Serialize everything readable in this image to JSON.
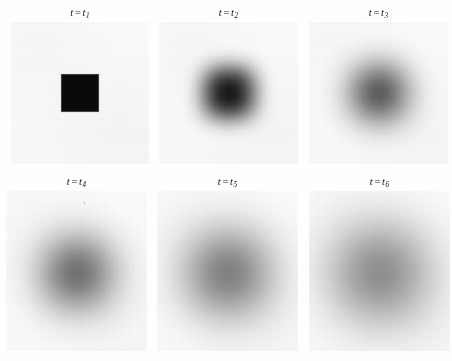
{
  "figure": {
    "title": "",
    "background_color": "#fefefe",
    "panel_background_color": "#fbfbfa",
    "blob_color": "#0a0a0a",
    "rows": 2,
    "columns": 3
  },
  "panels": [
    {
      "id": "panel-t1",
      "label_prefix": "t",
      "label_eq": "=",
      "label_var": "t",
      "label_sub": "1",
      "label_text": "t = t1",
      "state": "sharp-square",
      "x": 11,
      "y": 22,
      "width": 138,
      "height": 142,
      "blob": {
        "size": 37,
        "radius": 0,
        "blur": 0,
        "opacity": 1.0,
        "offset_x": 0,
        "offset_y": 0
      }
    },
    {
      "id": "panel-t2",
      "label_prefix": "t",
      "label_eq": "=",
      "label_var": "t",
      "label_sub": "2",
      "label_text": "t = t2",
      "state": "blurred-square",
      "x": 159,
      "y": 22,
      "width": 139,
      "height": 142,
      "blob": {
        "size": 48,
        "radius": 12,
        "blur": 11,
        "opacity": 0.97,
        "offset_x": 0,
        "offset_y": 0
      }
    },
    {
      "id": "panel-t3",
      "label_prefix": "t",
      "label_eq": "=",
      "label_var": "t",
      "label_sub": "3",
      "label_text": "t = t3",
      "state": "rounded-blob",
      "x": 309,
      "y": 22,
      "width": 139,
      "height": 142,
      "blob": {
        "size": 52,
        "radius": 26,
        "blur": 17,
        "opacity": 0.9,
        "offset_x": 0,
        "offset_y": 0
      }
    },
    {
      "id": "panel-t4",
      "label_prefix": "t",
      "label_eq": "=",
      "label_var": "t",
      "label_sub": "4",
      "label_text": "t = t4",
      "state": "diffuse-circle",
      "x": 6,
      "y": 191,
      "width": 141,
      "height": 160,
      "blob": {
        "size": 62,
        "radius": 50,
        "blur": 22,
        "opacity": 0.84,
        "offset_x": 0,
        "offset_y": 2
      }
    },
    {
      "id": "panel-t5",
      "label_prefix": "t",
      "label_eq": "=",
      "label_var": "t",
      "label_sub": "5",
      "label_text": "t = t5",
      "state": "diffuse-circle",
      "x": 157,
      "y": 191,
      "width": 141,
      "height": 160,
      "blob": {
        "size": 70,
        "radius": 50,
        "blur": 26,
        "opacity": 0.8,
        "offset_x": 0,
        "offset_y": 2
      }
    },
    {
      "id": "panel-t6",
      "label_prefix": "t",
      "label_eq": "=",
      "label_var": "t",
      "label_sub": "6",
      "label_text": "t = t6",
      "state": "diffuse-circle",
      "x": 309,
      "y": 191,
      "width": 141,
      "height": 160,
      "blob": {
        "size": 76,
        "radius": 50,
        "blur": 30,
        "opacity": 0.76,
        "offset_x": 0,
        "offset_y": 2
      }
    }
  ]
}
